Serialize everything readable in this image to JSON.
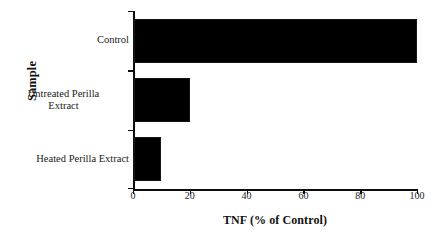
{
  "chart_data": {
    "type": "bar",
    "orientation": "horizontal",
    "title": "",
    "xlabel": "TNF (% of Control)",
    "ylabel": "Sample",
    "categories": [
      "Control",
      "Untreated Perilla Extract",
      "Heated Perilla Extract"
    ],
    "category_lines": [
      [
        "Control"
      ],
      [
        "Untreated Perilla",
        "Extract"
      ],
      [
        "Heated Perilla Extract"
      ]
    ],
    "values": [
      100,
      20,
      10
    ],
    "xlim": [
      0,
      100
    ],
    "xticks": [
      0,
      20,
      40,
      60,
      80,
      100
    ],
    "xtick_labels": [
      "0",
      "20",
      "40",
      "60",
      "80",
      "100"
    ],
    "grid": false,
    "legend": false,
    "bar_color": "#000000",
    "axis_color": "#0d0d0d",
    "background": "#ffffff"
  }
}
